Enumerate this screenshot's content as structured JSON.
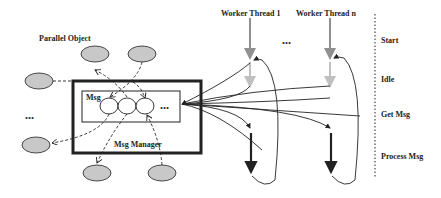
{
  "diagram": {
    "left": {
      "title": "Parallel Object",
      "queue_label": "Msg",
      "manager_label": "Msg Manager",
      "ellipsis": "..."
    },
    "threads": [
      {
        "label": "Worker Thread 1"
      },
      {
        "label": "Worker Thread n"
      }
    ],
    "threads_ellipsis": "...",
    "phases": [
      "Start",
      "Idle",
      "Get Msg",
      "Process Msg"
    ],
    "colors": {
      "object_fill": "#c8c8c8",
      "stroke": "#222222",
      "thread_gray": "#909090",
      "idle_gray": "#c0c0c0"
    }
  }
}
